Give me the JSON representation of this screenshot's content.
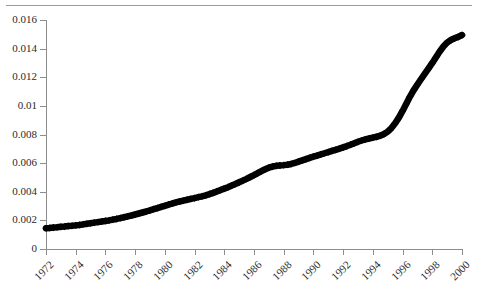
{
  "chart_data": {
    "type": "line",
    "title": "",
    "subtitle": "",
    "xlabel": "",
    "ylabel": "",
    "grid": false,
    "legend": "none",
    "xlim": [
      1972,
      2000
    ],
    "ylim": [
      0,
      0.016
    ],
    "x_tick_labels": [
      "1972",
      "1974",
      "1976",
      "1978",
      "1980",
      "1982",
      "1984",
      "1986",
      "1988",
      "1990",
      "1992",
      "1994",
      "1996",
      "1998",
      "2000"
    ],
    "x_tick_values": [
      1972,
      1974,
      1976,
      1978,
      1980,
      1982,
      1984,
      1986,
      1988,
      1990,
      1992,
      1994,
      1996,
      1998,
      2000
    ],
    "y_tick_labels": [
      "0",
      "0.002",
      "0.004",
      "0.006",
      "0.008",
      "0.01",
      "0.012",
      "0.014",
      "0.016"
    ],
    "y_tick_values": [
      0,
      0.002,
      0.004,
      0.006,
      0.008,
      0.01,
      0.012,
      0.014,
      0.016
    ],
    "marker": "filled-diamond",
    "marker_color": "#000000",
    "line_color": "#000000",
    "series": [
      {
        "name": "series-1",
        "x": [
          1972.0,
          1972.25,
          1972.5,
          1972.75,
          1973.0,
          1973.25,
          1973.5,
          1973.75,
          1974.0,
          1974.25,
          1974.5,
          1974.75,
          1975.0,
          1975.25,
          1975.5,
          1975.75,
          1976.0,
          1976.25,
          1976.5,
          1976.75,
          1977.0,
          1977.25,
          1977.5,
          1977.75,
          1978.0,
          1978.25,
          1978.5,
          1978.75,
          1979.0,
          1979.25,
          1979.5,
          1979.75,
          1980.0,
          1980.25,
          1980.5,
          1980.75,
          1981.0,
          1981.25,
          1981.5,
          1981.75,
          1982.0,
          1982.25,
          1982.5,
          1982.75,
          1983.0,
          1983.25,
          1983.5,
          1983.75,
          1984.0,
          1984.25,
          1984.5,
          1984.75,
          1985.0,
          1985.25,
          1985.5,
          1985.75,
          1986.0,
          1986.25,
          1986.5,
          1986.75,
          1987.0,
          1987.25,
          1987.5,
          1987.75,
          1988.0,
          1988.25,
          1988.5,
          1988.75,
          1989.0,
          1989.25,
          1989.5,
          1989.75,
          1990.0,
          1990.25,
          1990.5,
          1990.75,
          1991.0,
          1991.25,
          1991.5,
          1991.75,
          1992.0,
          1992.25,
          1992.5,
          1992.75,
          1993.0,
          1993.25,
          1993.5,
          1993.75,
          1994.0,
          1994.25,
          1994.5,
          1994.75,
          1995.0,
          1995.25,
          1995.5,
          1995.75,
          1996.0,
          1996.25,
          1996.5,
          1996.75,
          1997.0,
          1997.25,
          1997.5,
          1997.75,
          1998.0,
          1998.25,
          1998.5,
          1998.75,
          1999.0,
          1999.25,
          1999.5,
          1999.75,
          2000.0
        ],
        "y": [
          0.00145,
          0.00147,
          0.0015,
          0.00152,
          0.00155,
          0.00157,
          0.0016,
          0.00162,
          0.00165,
          0.00168,
          0.00172,
          0.00176,
          0.0018,
          0.00184,
          0.00188,
          0.00192,
          0.00196,
          0.002,
          0.00205,
          0.0021,
          0.00216,
          0.00222,
          0.00228,
          0.00234,
          0.00241,
          0.00248,
          0.00255,
          0.00262,
          0.0027,
          0.00278,
          0.00286,
          0.00294,
          0.00302,
          0.0031,
          0.00318,
          0.00325,
          0.00332,
          0.00338,
          0.00344,
          0.0035,
          0.00356,
          0.00362,
          0.00368,
          0.00375,
          0.00383,
          0.00392,
          0.00402,
          0.00412,
          0.00422,
          0.00432,
          0.00443,
          0.00454,
          0.00466,
          0.00478,
          0.0049,
          0.00503,
          0.00516,
          0.0053,
          0.00544,
          0.00557,
          0.00568,
          0.00576,
          0.00581,
          0.00584,
          0.00586,
          0.00589,
          0.00594,
          0.00601,
          0.0061,
          0.00619,
          0.00628,
          0.00637,
          0.00645,
          0.00653,
          0.00661,
          0.00669,
          0.00677,
          0.00685,
          0.00693,
          0.00701,
          0.0071,
          0.00719,
          0.00729,
          0.00739,
          0.00749,
          0.00758,
          0.00766,
          0.00772,
          0.00778,
          0.00784,
          0.00792,
          0.00803,
          0.0082,
          0.00845,
          0.00878,
          0.00918,
          0.00965,
          0.01015,
          0.01065,
          0.0111,
          0.0115,
          0.01188,
          0.01225,
          0.01262,
          0.013,
          0.0134,
          0.0138,
          0.01415,
          0.01442,
          0.0146,
          0.01472,
          0.01482,
          0.01495
        ]
      }
    ]
  },
  "axes": {
    "y_labels": [
      "0.016",
      "0.014",
      "0.012",
      "0.01",
      "0.008",
      "0.006",
      "0.004",
      "0.002",
      "0"
    ],
    "x_labels": [
      "1972",
      "1974",
      "1976",
      "1978",
      "1980",
      "1982",
      "1984",
      "1986",
      "1988",
      "1990",
      "1992",
      "1994",
      "1996",
      "1998",
      "2000"
    ]
  }
}
